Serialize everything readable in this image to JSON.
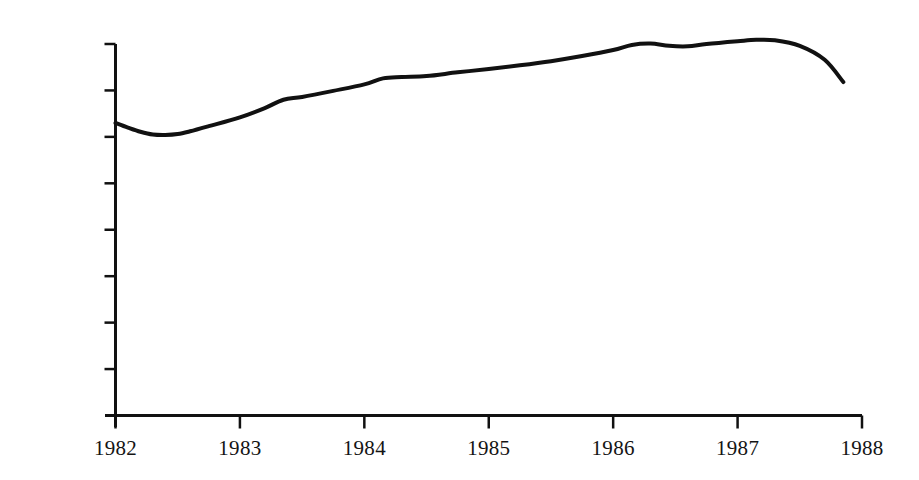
{
  "chart_data": {
    "type": "line",
    "title": "",
    "subtitle": "",
    "xlabel": "",
    "ylabel": "",
    "xlim": [
      1982,
      1988
    ],
    "ylim": [
      0,
      8400
    ],
    "grid": false,
    "legend": null,
    "x_tick_labels": [
      "1982",
      "1983",
      "1984",
      "1985",
      "1986",
      "1987",
      "1988"
    ],
    "x_ticks": [
      1982,
      1983,
      1984,
      1985,
      1986,
      1987,
      1988
    ],
    "y_tick_labels": [
      "1000",
      "2000",
      "3000",
      "4000",
      "5000",
      "6000",
      "7000",
      "8000"
    ],
    "y_ticks": [
      1000,
      2000,
      3000,
      4000,
      5000,
      6000,
      7000,
      8000
    ],
    "line_color": "#111111",
    "line_width": 4,
    "axis_color": "#111111",
    "background": "#ffffff",
    "series": [
      {
        "name": "series-1",
        "x": [
          1982.0,
          1982.1,
          1982.2,
          1982.3,
          1982.4,
          1982.5,
          1982.6,
          1982.75,
          1983.0,
          1983.2,
          1983.35,
          1983.5,
          1983.75,
          1984.0,
          1984.15,
          1984.3,
          1984.5,
          1984.75,
          1985.0,
          1985.25,
          1985.5,
          1985.75,
          1986.0,
          1986.15,
          1986.3,
          1986.45,
          1986.6,
          1986.75,
          1987.0,
          1987.15,
          1987.3,
          1987.5,
          1987.7,
          1987.85
        ],
        "y": [
          6300,
          6200,
          6110,
          6050,
          6040,
          6060,
          6120,
          6230,
          6420,
          6620,
          6800,
          6860,
          6990,
          7130,
          7260,
          7290,
          7310,
          7390,
          7460,
          7540,
          7630,
          7740,
          7870,
          7980,
          8010,
          7960,
          7950,
          8000,
          8060,
          8090,
          8080,
          7960,
          7660,
          7180
        ]
      }
    ]
  },
  "axes": {
    "y_axis_name": "value-axis",
    "x_axis_name": "year-axis"
  }
}
